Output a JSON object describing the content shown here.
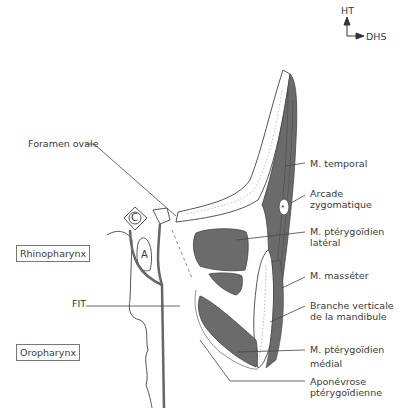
{
  "orientation": {
    "up_label": "HT",
    "right_label": "DHS"
  },
  "regions": {
    "rhinopharynx": "Rhinopharynx",
    "oropharynx": "Oropharynx"
  },
  "labels_left": {
    "foramen_ovale": "Foramen ovale",
    "fit": "FIT"
  },
  "labels_right": [
    {
      "id": "m-temporal",
      "lines": [
        "M. temporal"
      ]
    },
    {
      "id": "arcade-zygomatique",
      "lines": [
        "Arcade",
        "zygomatique"
      ]
    },
    {
      "id": "m-pterygoidien-lateral",
      "lines": [
        "M. ptérygoïdien",
        "latéral"
      ]
    },
    {
      "id": "m-masseter",
      "lines": [
        "M. masséter"
      ]
    },
    {
      "id": "branche-verticale",
      "lines": [
        "Branche verticale",
        "de la mandibule"
      ]
    },
    {
      "id": "m-pterygoidien-medial",
      "lines": [
        "M. ptérygoïdien",
        "médial"
      ]
    },
    {
      "id": "aponevrose",
      "lines": [
        "Aponévrose",
        "ptérygoïdienne"
      ]
    }
  ],
  "structure_letters": {
    "c": "C",
    "a": "A"
  },
  "colors": {
    "muscle": "#6b6b6b",
    "outline": "#555555",
    "bone_fill": "#ffffff"
  }
}
